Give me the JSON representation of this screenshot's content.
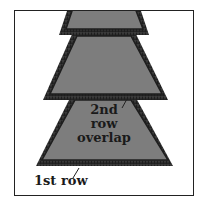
{
  "diagram": {
    "title": "",
    "colors": {
      "fill": "#7d7d7d",
      "fringe": "#2a2a2a",
      "frame": "#222222",
      "text": "#1a1a1a"
    },
    "shapes": [
      {
        "name": "top-row",
        "top": [
          73,
          135,
          10
        ],
        "bottom": [
          66,
          143,
          29
        ]
      },
      {
        "name": "middle-row",
        "top": [
          77,
          131,
          36
        ],
        "bottom": [
          50,
          162,
          94
        ]
      },
      {
        "name": "bottom-row",
        "top": [
          75,
          131,
          100
        ],
        "bottom": [
          42,
          168,
          160
        ]
      }
    ],
    "labels": {
      "second_row_line1": "2nd row",
      "second_row_line2": "overlap",
      "first_row": "1st row"
    }
  }
}
